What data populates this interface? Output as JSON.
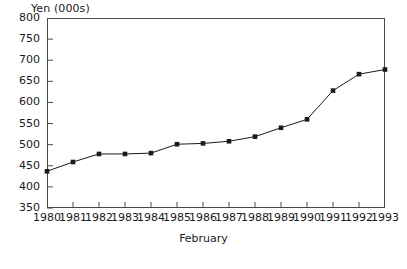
{
  "chart_data": {
    "type": "line",
    "title": "Yen (000s)",
    "xlabel": "February",
    "ylabel": "",
    "categories": [
      "1980",
      "1981",
      "1982",
      "1983",
      "1984",
      "1985",
      "1986",
      "1987",
      "1988",
      "1989",
      "1990",
      "1991",
      "1992",
      "1993"
    ],
    "values": [
      437,
      459,
      478,
      478,
      480,
      501,
      503,
      508,
      519,
      540,
      560,
      628,
      667,
      678
    ],
    "series": [
      {
        "name": "Yen (000s)",
        "values": [
          437,
          459,
          478,
          478,
          480,
          501,
          503,
          508,
          519,
          540,
          560,
          628,
          667,
          678
        ]
      }
    ],
    "ylim": [
      350,
      800
    ],
    "ytick_values": [
      800,
      750,
      700,
      650,
      600,
      550,
      500,
      450,
      400,
      350
    ],
    "ytick_labels": [
      "800",
      "750",
      "700",
      "650",
      "600",
      "550",
      "500",
      "450",
      "400",
      "350"
    ],
    "xtick_labels": [
      "1980",
      "1981",
      "1982",
      "1983",
      "1984",
      "1985",
      "1986",
      "1987",
      "1988",
      "1989",
      "1990",
      "1991",
      "1992",
      "1993"
    ],
    "grid": false,
    "legend": "none",
    "marker": "square",
    "line_color": "#1a1a1a",
    "marker_color": "#1a1a1a",
    "frame_color": "#4a4a4a",
    "background_color": "#ffffff"
  }
}
